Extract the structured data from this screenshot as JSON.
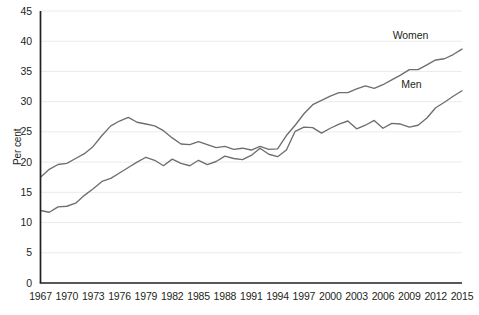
{
  "chart_data": {
    "type": "line",
    "title": "",
    "xlabel": "",
    "ylabel": "Per cent",
    "ylim": [
      0,
      45
    ],
    "xlim": [
      1967,
      2015
    ],
    "grid": true,
    "legend_position": "inline-right",
    "ytick_labels": [
      "0",
      "5",
      "10",
      "15",
      "20",
      "25",
      "30",
      "35",
      "40",
      "45"
    ],
    "ytick_values": [
      0,
      5,
      10,
      15,
      20,
      25,
      30,
      35,
      40,
      45
    ],
    "xtick_labels": [
      "1967",
      "1970",
      "1973",
      "1976",
      "1979",
      "1982",
      "1985",
      "1988",
      "1991",
      "1994",
      "1997",
      "2000",
      "2003",
      "2006",
      "2009",
      "2012",
      "2015"
    ],
    "xtick_values": [
      1967,
      1970,
      1973,
      1976,
      1979,
      1982,
      1985,
      1988,
      1991,
      1994,
      1997,
      2000,
      2003,
      2006,
      2009,
      2012,
      2015
    ],
    "x": [
      1967,
      1968,
      1969,
      1970,
      1971,
      1972,
      1973,
      1974,
      1975,
      1976,
      1977,
      1978,
      1979,
      1980,
      1981,
      1982,
      1983,
      1984,
      1985,
      1986,
      1987,
      1988,
      1989,
      1990,
      1991,
      1992,
      1993,
      1994,
      1995,
      1996,
      1997,
      1998,
      1999,
      2000,
      2001,
      2002,
      2003,
      2004,
      2005,
      2006,
      2007,
      2008,
      2009,
      2010,
      2011,
      2012,
      2013,
      2014,
      2015
    ],
    "series": [
      {
        "name": "Women",
        "color": "#6e6e6e",
        "values": [
          17.5,
          18.8,
          19.6,
          19.8,
          20.6,
          21.4,
          22.6,
          24.4,
          26.0,
          26.8,
          27.4,
          26.6,
          26.3,
          26.0,
          25.2,
          24.0,
          23.0,
          22.9,
          23.4,
          22.9,
          22.4,
          22.6,
          22.1,
          22.3,
          22.0,
          22.6,
          22.1,
          22.2,
          24.4,
          26.1,
          28.0,
          29.5,
          30.2,
          30.9,
          31.5,
          31.5,
          32.1,
          32.6,
          32.2,
          32.8,
          33.6,
          34.4,
          35.3,
          35.3,
          36.1,
          36.9,
          37.1,
          37.8,
          38.7
        ]
      },
      {
        "name": "Men",
        "color": "#6e6e6e",
        "values": [
          12.0,
          11.7,
          12.6,
          12.7,
          13.2,
          14.5,
          15.6,
          16.8,
          17.3,
          18.2,
          19.1,
          20.0,
          20.8,
          20.3,
          19.4,
          20.5,
          19.8,
          19.4,
          20.3,
          19.6,
          20.1,
          21.0,
          20.6,
          20.4,
          21.1,
          22.3,
          21.3,
          20.9,
          22.0,
          25.1,
          25.8,
          25.7,
          24.8,
          25.6,
          26.3,
          26.8,
          25.5,
          26.1,
          26.9,
          25.6,
          26.4,
          26.3,
          25.8,
          26.1,
          27.3,
          29.0,
          29.9,
          30.9,
          31.8
        ]
      }
    ],
    "annotations": [
      {
        "text": "Women",
        "x": 2010.3,
        "y": 41.1
      },
      {
        "text": "Men",
        "x": 2010.0,
        "y": 33.0
      }
    ]
  }
}
